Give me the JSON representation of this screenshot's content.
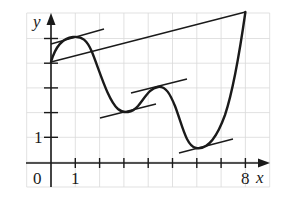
{
  "diagram": {
    "type": "function-graph",
    "axes": {
      "x_label": "x",
      "y_label": "y",
      "origin_label": "0",
      "x_tick_label": "1",
      "x_end_label": "8",
      "y_tick_label": "1",
      "x_range": [
        0,
        8
      ],
      "y_range": [
        0,
        6
      ],
      "grid": true
    },
    "colors": {
      "curve": "#1a1a1a",
      "grid": "#d9d9d9",
      "background": "#ffffff"
    },
    "key_points": [
      {
        "name": "start",
        "x": 0,
        "y": 4.0
      },
      {
        "name": "local-max-1",
        "x": 0.9,
        "y": 5.1
      },
      {
        "name": "local-min-1",
        "x": 3.0,
        "y": 2.0
      },
      {
        "name": "local-max-2",
        "x": 4.5,
        "y": 3.0
      },
      {
        "name": "global-min",
        "x": 6.0,
        "y": 0.6
      },
      {
        "name": "end",
        "x": 8,
        "y": 6.1
      }
    ],
    "tangent_lines": [
      {
        "at": "local-max-1",
        "from": [
          0,
          4.8
        ],
        "to": [
          2.2,
          5.4
        ]
      },
      {
        "at": "local-min-1",
        "from": [
          2.0,
          1.8
        ],
        "to": [
          4.3,
          2.4
        ]
      },
      {
        "at": "local-max-2",
        "from": [
          3.3,
          2.8
        ],
        "to": [
          5.6,
          3.4
        ]
      },
      {
        "at": "global-min",
        "from": [
          5.3,
          0.4
        ],
        "to": [
          7.5,
          1.0
        ]
      }
    ],
    "secant_line": {
      "from": [
        0,
        4.0
      ],
      "to": [
        8,
        6.1
      ]
    }
  }
}
